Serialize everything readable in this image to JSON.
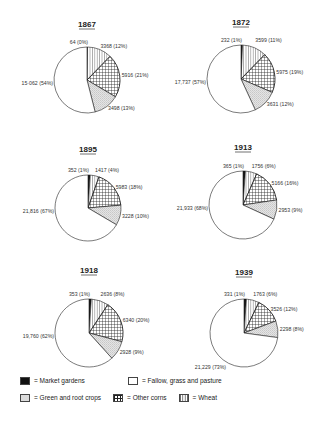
{
  "chart_data": [
    {
      "type": "pie",
      "title": "1867",
      "categories": [
        "Market gardens",
        "Wheat",
        "Other corns",
        "Green and root crops",
        "Fallow, grass and pasture"
      ],
      "values": [
        64,
        3368,
        5916,
        3498,
        15062
      ],
      "percents": [
        0,
        12,
        21,
        13,
        54
      ],
      "labels": [
        "64 (0%)",
        "3368 (12%)",
        "5916 (21%)",
        "3498 (13%)",
        "15·062 (54%)"
      ]
    },
    {
      "type": "pie",
      "title": "1872",
      "categories": [
        "Market gardens",
        "Wheat",
        "Other corns",
        "Green and root crops",
        "Fallow, grass and pasture"
      ],
      "values": [
        232,
        3599,
        5975,
        3631,
        17737
      ],
      "percents": [
        1,
        11,
        19,
        12,
        57
      ],
      "labels": [
        "232 (1%)",
        "3599 (11%)",
        "5975 (19%)",
        "3631 (12%)",
        "17,737 (57%)"
      ]
    },
    {
      "type": "pie",
      "title": "1895",
      "categories": [
        "Market gardens",
        "Wheat",
        "Other corns",
        "Green and root crops",
        "Fallow, grass and pasture"
      ],
      "values": [
        352,
        1417,
        5983,
        3228,
        21816
      ],
      "percents": [
        1,
        4,
        18,
        10,
        67
      ],
      "labels": [
        "352 (1%)",
        "1417 (4%)",
        "5983 (18%)",
        "3228 (10%)",
        "21,816 (67%)"
      ]
    },
    {
      "type": "pie",
      "title": "1913",
      "categories": [
        "Market gardens",
        "Wheat",
        "Other corns",
        "Green and root crops",
        "Fallow, grass and pasture"
      ],
      "values": [
        365,
        1756,
        5166,
        2953,
        21933
      ],
      "percents": [
        1,
        6,
        16,
        9,
        68
      ],
      "labels": [
        "365 (1%)",
        "1756 (6%)",
        "5166 (16%)",
        "2953 (9%)",
        "21,933 (68%)"
      ]
    },
    {
      "type": "pie",
      "title": "1918",
      "categories": [
        "Market gardens",
        "Wheat",
        "Other corns",
        "Green and root crops",
        "Fallow, grass and pasture"
      ],
      "values": [
        353,
        2636,
        6340,
        2928,
        19760
      ],
      "percents": [
        1,
        8,
        20,
        9,
        62
      ],
      "labels": [
        "353 (1%)",
        "2636 (8%)",
        "6340 (20%)",
        "2928 (9%)",
        "19,760 (62%)"
      ]
    },
    {
      "type": "pie",
      "title": "1939",
      "categories": [
        "Market gardens",
        "Wheat",
        "Other corns",
        "Green and root crops",
        "Fallow, grass and pasture"
      ],
      "values": [
        331,
        1763,
        3526,
        2298,
        21229
      ],
      "percents": [
        1,
        6,
        12,
        8,
        73
      ],
      "labels": [
        "331 (1%)",
        "1763 (6%)",
        "3526 (12%)",
        "2298 (8%)",
        "21,229 (73%)"
      ]
    }
  ],
  "legend": {
    "items": [
      {
        "key": "market",
        "label": "= Market gardens",
        "pattern": "solid-black"
      },
      {
        "key": "fallow",
        "label": "= Fallow, grass and pasture",
        "pattern": "blank"
      },
      {
        "key": "green",
        "label": "= Green and root crops",
        "pattern": "stipple"
      },
      {
        "key": "corns",
        "label": "= Other corns",
        "pattern": "crosshatch"
      },
      {
        "key": "wheat",
        "label": "= Wheat",
        "pattern": "vertical-lines"
      }
    ]
  },
  "colors": {
    "ink": "#222222",
    "background": "#ffffff",
    "market": "#111111",
    "stipple": "#d8d8d8"
  }
}
